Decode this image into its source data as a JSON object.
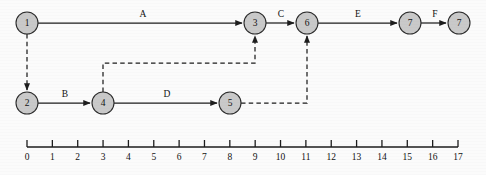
{
  "figure": {
    "type": "activity-network-timeline-diagram",
    "background_color": "#fbfbfb",
    "node_fill_color": "#c9c9c9",
    "node_stroke_color": "#2b2b2b",
    "line_color": "#1d1d1d"
  },
  "nodes": [
    {
      "id": "n1",
      "label": "1",
      "time": 0,
      "row": "top",
      "cx": 27,
      "cy": 23,
      "r": 11
    },
    {
      "id": "n3",
      "label": "3",
      "time": 9,
      "row": "top",
      "cx": 255,
      "cy": 23,
      "r": 11
    },
    {
      "id": "n6",
      "label": "6",
      "time": 11,
      "row": "top",
      "cx": 307,
      "cy": 23,
      "r": 11
    },
    {
      "id": "n7a",
      "label": "7",
      "time": 15,
      "row": "top",
      "cx": 410,
      "cy": 23,
      "r": 11
    },
    {
      "id": "n7b",
      "label": "7",
      "time": 17,
      "row": "top",
      "cx": 459,
      "cy": 23,
      "r": 11
    },
    {
      "id": "n2",
      "label": "2",
      "time": 0,
      "row": "bottom",
      "cx": 27,
      "cy": 103,
      "r": 11
    },
    {
      "id": "n4",
      "label": "4",
      "time": 3,
      "row": "bottom",
      "cx": 103,
      "cy": 103,
      "r": 11
    },
    {
      "id": "n5",
      "label": "5",
      "time": 8,
      "row": "bottom",
      "cx": 230,
      "cy": 103,
      "r": 11
    }
  ],
  "edges": [
    {
      "id": "eA",
      "label": "A",
      "from": "n1",
      "to": "n3",
      "style": "solid",
      "label_x": 143,
      "label_y": 17
    },
    {
      "id": "eC",
      "label": "C",
      "from": "n3",
      "to": "n6",
      "style": "solid",
      "label_x": 281,
      "label_y": 17
    },
    {
      "id": "eE",
      "label": "E",
      "from": "n6",
      "to": "n7a",
      "style": "solid",
      "label_x": 358,
      "label_y": 17
    },
    {
      "id": "eF",
      "label": "F",
      "from": "n7a",
      "to": "n7b",
      "style": "solid",
      "label_x": 435,
      "label_y": 17
    },
    {
      "id": "eB",
      "label": "B",
      "from": "n2",
      "to": "n4",
      "style": "solid",
      "label_x": 65,
      "label_y": 97
    },
    {
      "id": "eD",
      "label": "D",
      "from": "n4",
      "to": "n5",
      "style": "solid",
      "label_x": 167,
      "label_y": 97
    },
    {
      "id": "d12",
      "label": "",
      "from": "n1",
      "to": "n2",
      "style": "dashed",
      "label_x": 0,
      "label_y": 0
    },
    {
      "id": "d43",
      "label": "",
      "from": "n4",
      "to": "n3",
      "style": "dashed",
      "label_x": 0,
      "label_y": 0
    },
    {
      "id": "d56",
      "label": "",
      "from": "n5",
      "to": "n6",
      "style": "dashed",
      "label_x": 0,
      "label_y": 0
    }
  ],
  "axis": {
    "baseline_y": 147,
    "tick_height": 7,
    "x_start": 27,
    "x_end": 458,
    "label_y": 160,
    "ticks": [
      "0",
      "1",
      "2",
      "3",
      "4",
      "5",
      "6",
      "7",
      "8",
      "9",
      "10",
      "11",
      "12",
      "13",
      "14",
      "15",
      "16",
      "17"
    ]
  }
}
